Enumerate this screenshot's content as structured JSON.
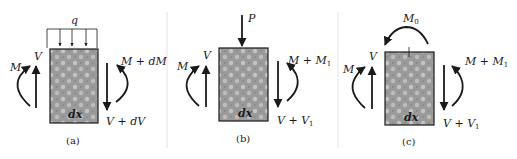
{
  "figure": {
    "colors": {
      "ink": "#1a1a1a",
      "box_fill": "#9a9a9a",
      "box_speckle": "#c8c8c8",
      "separator": "#e4e4e4",
      "background": "#ffffff"
    },
    "panels": [
      {
        "id": "a",
        "caption": "(a)",
        "load_label": "q",
        "element_label": "dx",
        "left_shear": "V",
        "left_moment": "M",
        "right_moment": "M + dM",
        "right_shear": "V + dV"
      },
      {
        "id": "b",
        "caption": "(b)",
        "load_label": "P",
        "element_label": "dx",
        "left_shear": "V",
        "left_moment": "M",
        "right_moment_main": "M + M",
        "right_moment_sub": "1",
        "right_shear_main": "V + V",
        "right_shear_sub": "1"
      },
      {
        "id": "c",
        "caption": "(c)",
        "load_label_main": "M",
        "load_label_sub": "0",
        "element_label": "dx",
        "left_shear": "V",
        "left_moment": "M",
        "right_moment_main": "M + M",
        "right_moment_sub": "1",
        "right_shear_main": "V + V",
        "right_shear_sub": "1"
      }
    ]
  }
}
